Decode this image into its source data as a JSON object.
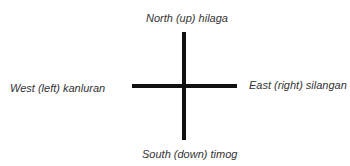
{
  "diagram": {
    "type": "compass-directions",
    "labels": {
      "north": "North (up) hilaga",
      "south": "South (down) timog",
      "west": "West (left) kanluran",
      "east": "East (right) silangan"
    },
    "colors": {
      "line": "#111111",
      "text": "#333333",
      "background": "#ffffff"
    }
  }
}
